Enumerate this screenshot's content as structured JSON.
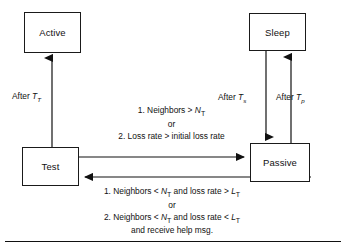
{
  "diagram": {
    "type": "state-transition-diagram",
    "states": [
      {
        "id": "active",
        "label": "Active"
      },
      {
        "id": "sleep",
        "label": "Sleep"
      },
      {
        "id": "test",
        "label": "Test"
      },
      {
        "id": "passive",
        "label": "Passive"
      }
    ],
    "transitions": [
      {
        "id": "test-to-active",
        "from": "Test",
        "to": "Active",
        "direction": "up",
        "label_prefix": "After ",
        "label_symbol": "T",
        "label_subscript": "T"
      },
      {
        "id": "sleep-to-passive",
        "from": "Sleep",
        "to": "Passive",
        "direction": "down",
        "label_prefix": "After ",
        "label_symbol": "T",
        "label_subscript": "s"
      },
      {
        "id": "passive-to-sleep",
        "from": "Passive",
        "to": "Sleep",
        "direction": "up",
        "label_prefix": "After ",
        "label_symbol": "T",
        "label_subscript": "p"
      },
      {
        "id": "test-to-passive",
        "from": "Test",
        "to": "Passive",
        "direction": "right",
        "conditions": [
          "1. Neighbors > N",
          "or",
          "2. Loss rate > initial loss rate"
        ]
      },
      {
        "id": "passive-to-test",
        "from": "Passive",
        "to": "Test",
        "direction": "left",
        "conditions": [
          "1. Neighbors < N",
          "or",
          "2. Neighbors < N",
          "and receive help msg."
        ]
      }
    ],
    "condition_top": {
      "line1_pre": "1. Neighbors > ",
      "line1_sym": "N",
      "line1_sub": "T",
      "line2": "or",
      "line3": "2. Loss rate > initial loss rate"
    },
    "condition_bottom": {
      "line1_pre": "1. Neighbors < ",
      "line1_sym": "N",
      "line1_sub": "T",
      "line1_mid": " and loss rate > ",
      "line1_sym2": "L",
      "line1_sub2": "T",
      "line2": "or",
      "line3_pre": "2. Neighbors < ",
      "line3_sym": "N",
      "line3_sub": "T",
      "line3_mid": " and loss rate < ",
      "line3_sym2": "L",
      "line3_sub2": "T",
      "line4": "and receive help msg."
    }
  },
  "colors": {
    "stroke": "#1a1a1a",
    "text": "#111111",
    "background": "#ffffff"
  }
}
